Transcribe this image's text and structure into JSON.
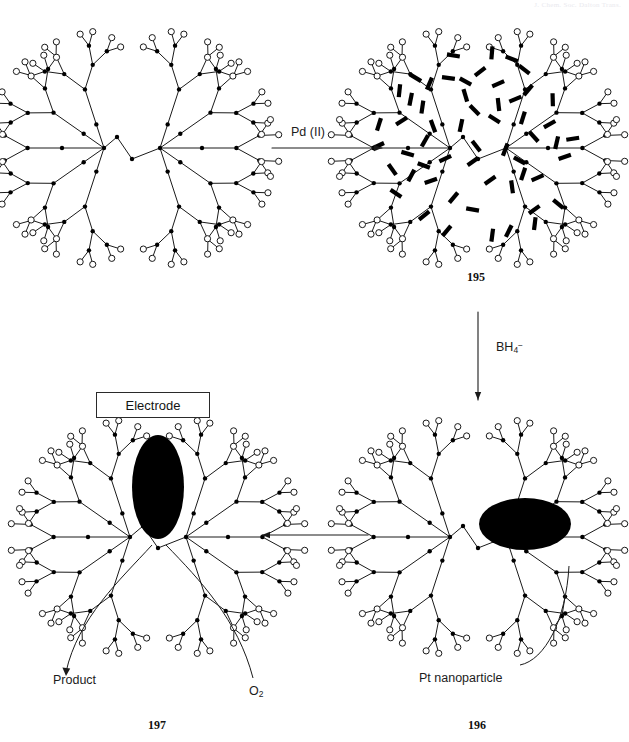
{
  "page": {
    "width": 629,
    "height": 742,
    "background": "#ffffff",
    "running_header": "J. Chem. Soc. Dalton Trans.",
    "ink": "#111111"
  },
  "reagents": {
    "pd_label": "Pd (II)",
    "bh4_label": "BH",
    "bh4_sub": "4",
    "bh4_sup": "−"
  },
  "annotations": {
    "electrode": "Electrode",
    "pt_nanoparticle": "Pt nanoparticle",
    "product": "Product",
    "oxygen": "O",
    "oxygen_sub": "2"
  },
  "compounds": {
    "c195": "195",
    "c196": "196",
    "c197": "197"
  },
  "structures": [
    {
      "id": "dendrimer-plain",
      "name": "unloaded-dendrimer",
      "cx": 132,
      "cy": 148,
      "rods": 0,
      "particle": null,
      "label": null
    },
    {
      "id": "dendrimer-pd",
      "name": "pd-loaded-dendrimer",
      "cx": 478,
      "cy": 148,
      "rods": 56,
      "particle": null,
      "label": "195"
    },
    {
      "id": "dendrimer-pt",
      "name": "pt-nanoparticle-dendrimer",
      "cx": 478,
      "cy": 537,
      "rods": 0,
      "particle": {
        "shape": "ellipse",
        "cx": 525,
        "cy": 524,
        "rx": 46,
        "ry": 26,
        "fill": "#000000"
      },
      "label": "196"
    },
    {
      "id": "dendrimer-electrode",
      "name": "electrode-bound-dendrimer",
      "cx": 158,
      "cy": 537,
      "rods": 0,
      "particle": {
        "shape": "ellipse",
        "cx": 158,
        "cy": 487,
        "rx": 26,
        "ry": 52,
        "fill": "#000000"
      },
      "label": "197"
    }
  ],
  "arrows": [
    {
      "name": "arrow-pd",
      "from": [
        272,
        148
      ],
      "to": [
        382,
        148
      ],
      "dir": "right",
      "label": "Pd (II)"
    },
    {
      "name": "arrow-bh4",
      "from": [
        478,
        312
      ],
      "to": [
        478,
        400
      ],
      "dir": "down",
      "label": "BH4-"
    },
    {
      "name": "arrow-to-electrode",
      "from": [
        368,
        535
      ],
      "to": [
        262,
        535
      ],
      "dir": "left",
      "label": ""
    }
  ],
  "colors": {
    "stroke": "#1a1a1a",
    "node_fill": "#000000",
    "terminal_fill": "#ffffff",
    "rod_fill": "#000000",
    "particle_fill": "#000000",
    "box_border": "#2a2a2a"
  },
  "geometry": {
    "node_radius": 2.2,
    "terminal_radius": 3.1,
    "generations": 4,
    "rod_length": 13,
    "rod_width": 4.2
  }
}
